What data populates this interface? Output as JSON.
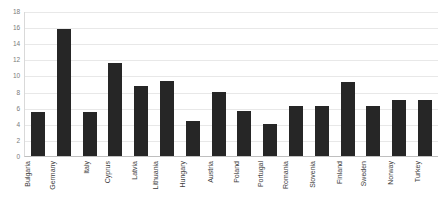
{
  "chart_data": {
    "type": "bar",
    "title": "",
    "subtitle": "",
    "xlabel": "",
    "ylabel": "",
    "categories": [
      "Bulgaria",
      "Germany",
      "Italy",
      "Cyprus",
      "Latvia",
      "Lithuania",
      "Hungary",
      "Austria",
      "Poland",
      "Portugal",
      "Romania",
      "Slovenia",
      "Finland",
      "Sweden",
      "Norway",
      "Turkey"
    ],
    "values": [
      5.5,
      15.8,
      5.5,
      11.6,
      8.7,
      9.3,
      4.4,
      8.0,
      5.6,
      4.0,
      6.2,
      6.2,
      9.2,
      6.2,
      6.9,
      7.0
    ],
    "ylim": [
      0,
      18
    ],
    "yticks": [
      0,
      2,
      4,
      6,
      8,
      10,
      12,
      14,
      16,
      18
    ],
    "ytick_labels": [
      "0",
      "2",
      "4",
      "6",
      "8",
      "10",
      "12",
      "14",
      "16",
      "18"
    ],
    "grid": true,
    "legend": false,
    "legend_position": "none",
    "bar_color": "#262626",
    "grid_color": "#e8e8e8",
    "axis_color": "#bfbfbf",
    "tick_label_color": "#7a7a7a",
    "category_label_color": "#3d3d3d",
    "category_label_rotation": -90,
    "background_color": "#ffffff"
  }
}
